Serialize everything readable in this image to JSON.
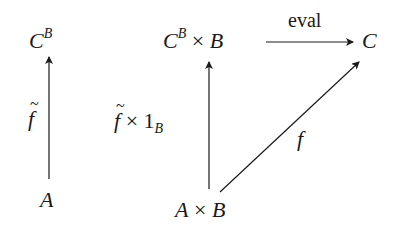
{
  "diagram": {
    "nodes": {
      "left_top": {
        "base": "C",
        "sup": "B"
      },
      "left_bottom": {
        "base": "A"
      },
      "mid_top": {
        "base": "C",
        "sup": "B",
        "op": "×",
        "factor": "B"
      },
      "mid_bottom": {
        "base": "A",
        "op": "×",
        "factor": "B"
      },
      "right_top": {
        "base": "C"
      }
    },
    "edges": {
      "left_vertical": {
        "label": "f",
        "decoration": "tilde",
        "from": "A",
        "to": "C^B"
      },
      "mid_vertical": {
        "label_f": "f",
        "label_op": "×",
        "label_one": "1",
        "label_sub": "B",
        "from": "A × B",
        "to": "C^B × B"
      },
      "top_horizontal": {
        "label": "eval",
        "from": "C^B × B",
        "to": "C"
      },
      "diagonal": {
        "label": "f",
        "from": "A × B",
        "to": "C"
      }
    },
    "color": "#1a1a1a"
  }
}
